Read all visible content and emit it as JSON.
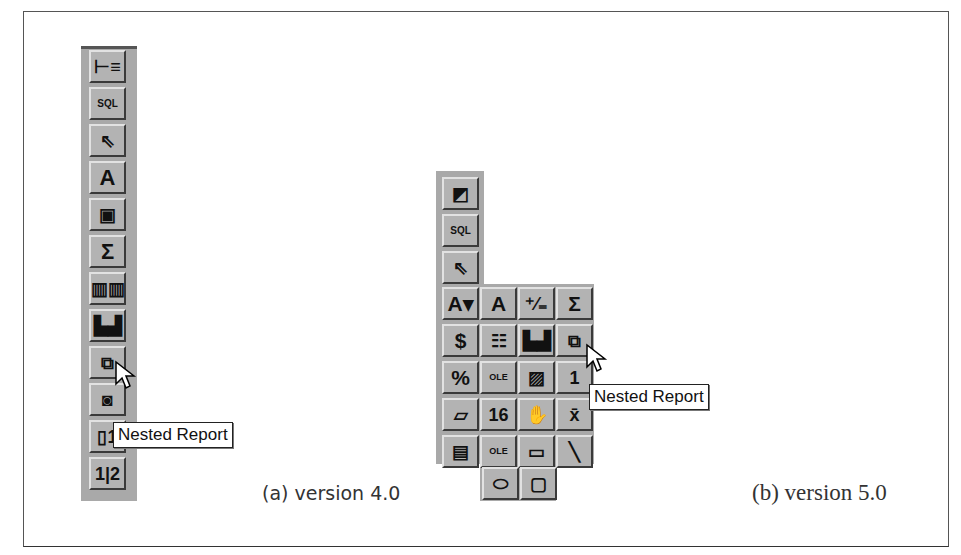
{
  "figure": {
    "left_panel": {
      "caption": "(a) version 4.0",
      "tooltip": "Nested Report",
      "buttons": [
        {
          "name": "query-icon",
          "glyph": "⊢≡"
        },
        {
          "name": "sql-icon",
          "glyph": "SQL"
        },
        {
          "name": "pointer-icon",
          "glyph": "⇖"
        },
        {
          "name": "text-icon",
          "glyph": "A"
        },
        {
          "name": "field-box-icon",
          "glyph": "▣"
        },
        {
          "name": "sum-icon",
          "glyph": "Σ"
        },
        {
          "name": "columns-icon",
          "glyph": "▥▥"
        },
        {
          "name": "chart-icon",
          "glyph": "▙▟"
        },
        {
          "name": "nested-report-icon",
          "glyph": "⧉"
        },
        {
          "name": "trash-icon",
          "glyph": "◙"
        },
        {
          "name": "report-page-icon",
          "glyph": "▯1"
        },
        {
          "name": "page-number-icon",
          "glyph": "1|2"
        }
      ]
    },
    "right_panel": {
      "caption": "(b) version 5.0",
      "tooltip": "Nested Report",
      "column_buttons": [
        {
          "name": "preview-icon",
          "glyph": "◩"
        },
        {
          "name": "sql-icon",
          "glyph": "SQL"
        },
        {
          "name": "pointer-icon",
          "glyph": "⇖"
        }
      ],
      "grid_rows": [
        [
          {
            "name": "text-dropdown-icon",
            "glyph": "A▾"
          },
          {
            "name": "text-icon",
            "glyph": "A"
          },
          {
            "name": "plus-minus-icon",
            "glyph": "⁺⁄₌"
          },
          {
            "name": "sum-icon",
            "glyph": "Σ"
          }
        ],
        [
          {
            "name": "currency-icon",
            "glyph": "$"
          },
          {
            "name": "table-icon",
            "glyph": "☷"
          },
          {
            "name": "chart-icon",
            "glyph": "▙▟"
          },
          {
            "name": "nested-report-icon",
            "glyph": "⧉"
          }
        ],
        [
          {
            "name": "percent-icon",
            "glyph": "%"
          },
          {
            "name": "ole-icon",
            "glyph": "OLE"
          },
          {
            "name": "picture-icon",
            "glyph": "▨"
          },
          {
            "name": "page-icon",
            "glyph": "1"
          }
        ],
        [
          {
            "name": "eraser-icon",
            "glyph": "▱"
          },
          {
            "name": "calendar-icon",
            "glyph": "16"
          },
          {
            "name": "hand-icon",
            "glyph": "✋"
          },
          {
            "name": "mean-icon",
            "glyph": "x̄"
          }
        ],
        [
          {
            "name": "insert-table-icon",
            "glyph": "▤"
          },
          {
            "name": "ole-object-icon",
            "glyph": "OLE"
          },
          {
            "name": "rectangle-icon",
            "glyph": "▭"
          },
          {
            "name": "line-icon",
            "glyph": "╲"
          }
        ]
      ],
      "bottom_row": [
        {
          "name": "ellipse-icon",
          "glyph": "⬭"
        },
        {
          "name": "rounded-rect-icon",
          "glyph": "▢"
        }
      ]
    }
  }
}
